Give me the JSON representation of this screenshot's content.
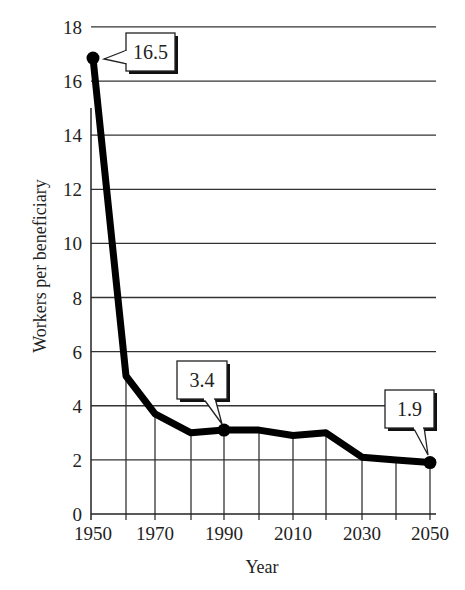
{
  "chart_data": {
    "type": "line",
    "title": "",
    "xlabel": "Year",
    "ylabel": "Workers per beneficiary",
    "x": [
      1950,
      1960,
      1970,
      1980,
      1990,
      2000,
      2010,
      2020,
      2030,
      2040,
      2050
    ],
    "series": [
      {
        "name": "Workers per beneficiary",
        "values": [
          16.5,
          5.1,
          3.7,
          3.0,
          3.4,
          3.1,
          2.9,
          3.0,
          2.1,
          2.0,
          1.9
        ]
      }
    ],
    "annotations": [
      {
        "x": 1950,
        "label": "16.5"
      },
      {
        "x": 1990,
        "label": "3.4"
      },
      {
        "x": 2050,
        "label": "1.9"
      }
    ],
    "x_tick_labels": [
      "1950",
      "1970",
      "1990",
      "2010",
      "2030",
      "2050"
    ],
    "y_tick_labels": [
      "0",
      "2",
      "4",
      "6",
      "8",
      "10",
      "12",
      "14",
      "16",
      "18"
    ],
    "xlim": [
      1950,
      2050
    ],
    "ylim": [
      0,
      18
    ],
    "grid": true,
    "legend": "none"
  },
  "labels": {
    "xlabel": "Year",
    "ylabel": "Workers per beneficiary",
    "callout_1950": "16.5",
    "callout_1990": "3.4",
    "callout_2050": "1.9"
  }
}
